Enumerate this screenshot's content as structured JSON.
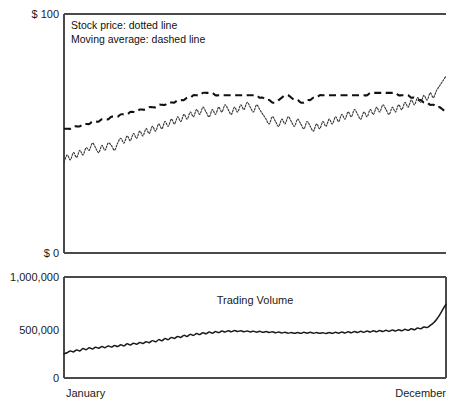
{
  "chart_data": {
    "type": "line",
    "title": "",
    "panels": [
      {
        "name": "price-panel",
        "ylabel": "",
        "xlabel": "",
        "ylim": [
          0,
          100
        ],
        "y_ticks": [
          {
            "value": 100,
            "label": "$ 100"
          },
          {
            "value": 0,
            "label": "$ 0"
          }
        ],
        "grid": false,
        "legend_position": "top-left",
        "annotations": [
          "Stock price: dotted line",
          "Moving average: dashed line"
        ],
        "series": [
          {
            "name": "Stock price",
            "style": "dotted",
            "color": "#3a3a3a",
            "values": [
              38,
              41,
              39,
              42,
              40,
              43,
              41,
              44,
              43,
              46,
              44,
              42,
              45,
              43,
              46,
              45,
              43,
              46,
              48,
              46,
              49,
              47,
              50,
              48,
              51,
              49,
              52,
              50,
              53,
              51,
              54,
              52,
              55,
              53,
              56,
              54,
              57,
              55,
              58,
              56,
              59,
              57,
              60,
              58,
              61,
              59,
              57,
              60,
              58,
              61,
              59,
              62,
              60,
              58,
              61,
              59,
              62,
              60,
              63,
              61,
              59,
              62,
              60,
              58,
              56,
              54,
              57,
              55,
              53,
              56,
              54,
              57,
              55,
              53,
              56,
              54,
              52,
              55,
              53,
              51,
              54,
              52,
              55,
              53,
              56,
              54,
              57,
              55,
              58,
              56,
              59,
              57,
              60,
              58,
              56,
              59,
              57,
              60,
              58,
              61,
              59,
              62,
              60,
              58,
              61,
              59,
              62,
              60,
              63,
              61,
              64,
              62,
              65,
              63,
              66,
              64,
              67,
              65,
              68,
              70,
              72,
              74
            ]
          },
          {
            "name": "Moving average",
            "style": "dashed",
            "color": "#111111",
            "values": [
              52,
              52,
              52,
              53,
              53,
              53,
              54,
              54,
              54,
              55,
              55,
              55,
              56,
              56,
              56,
              57,
              57,
              57,
              58,
              58,
              58,
              59,
              59,
              59,
              60,
              60,
              60,
              61,
              61,
              61,
              62,
              62,
              62,
              63,
              63,
              63,
              64,
              64,
              64,
              65,
              65,
              66,
              66,
              66,
              67,
              67,
              67,
              67,
              66,
              66,
              66,
              66,
              66,
              66,
              66,
              66,
              66,
              66,
              66,
              66,
              66,
              66,
              65,
              65,
              64,
              64,
              63,
              63,
              64,
              65,
              66,
              66,
              65,
              64,
              64,
              63,
              63,
              64,
              64,
              65,
              65,
              66,
              66,
              66,
              66,
              66,
              66,
              66,
              66,
              66,
              66,
              66,
              66,
              66,
              66,
              66,
              66,
              67,
              67,
              67,
              67,
              67,
              67,
              67,
              67,
              67,
              66,
              66,
              66,
              66,
              65,
              65,
              64,
              64,
              63,
              63,
              62,
              62,
              61,
              61,
              60,
              59
            ]
          }
        ]
      },
      {
        "name": "volume-panel",
        "ylabel": "",
        "xlabel": "",
        "ylim": [
          0,
          1000000
        ],
        "y_ticks": [
          {
            "value": 1000000,
            "label": "1,000,000"
          },
          {
            "value": 500000,
            "label": "500,000"
          },
          {
            "value": 0,
            "label": "0"
          }
        ],
        "grid": false,
        "annotations": [
          "Trading Volume"
        ],
        "series": [
          {
            "name": "Trading Volume",
            "style": "solid",
            "color": "#1a1a1a",
            "values": [
              240000,
              250000,
              268000,
              258000,
              278000,
              268000,
              292000,
              280000,
              300000,
              288000,
              305000,
              295000,
              312000,
              300000,
              318000,
              306000,
              322000,
              312000,
              330000,
              318000,
              338000,
              326000,
              345000,
              334000,
              352000,
              342000,
              360000,
              350000,
              370000,
              358000,
              380000,
              368000,
              392000,
              380000,
              402000,
              392000,
              412000,
              402000,
              422000,
              412000,
              432000,
              422000,
              440000,
              430000,
              448000,
              438000,
              455000,
              444000,
              460000,
              450000,
              465000,
              455000,
              468000,
              458000,
              470000,
              460000,
              468000,
              458000,
              466000,
              456000,
              464000,
              454000,
              462000,
              452000,
              460000,
              450000,
              458000,
              448000,
              455000,
              446000,
              452000,
              444000,
              450000,
              442000,
              450000,
              442000,
              452000,
              444000,
              452000,
              444000,
              450000,
              442000,
              448000,
              440000,
              450000,
              442000,
              452000,
              444000,
              455000,
              446000,
              458000,
              448000,
              460000,
              450000,
              462000,
              452000,
              465000,
              455000,
              468000,
              458000,
              470000,
              460000,
              472000,
              462000,
              475000,
              465000,
              478000,
              468000,
              482000,
              472000,
              488000,
              478000,
              495000,
              488000,
              505000,
              500000,
              520000,
              545000,
              580000,
              625000,
              680000,
              730000
            ]
          }
        ]
      }
    ],
    "x_ticks": [
      {
        "position": 0,
        "label": "January"
      },
      {
        "position": 1,
        "label": "December"
      }
    ],
    "x_range": [
      "January",
      "December"
    ]
  },
  "labels": {
    "price_top": "$ 100",
    "price_bottom": "$ 0",
    "volume_top": "1,000,000",
    "volume_mid": "500,000",
    "volume_bottom": "0",
    "x_start": "January",
    "x_end": "December",
    "legend_line_1": "Stock price: dotted line",
    "legend_line_2": "Moving average: dashed line",
    "volume_title": "Trading Volume"
  },
  "colors": {
    "axis": "#4a4a4a",
    "price_line": "#3a3a3a",
    "ma_line": "#111111",
    "volume_line": "#1a1a1a",
    "background": "#ffffff"
  }
}
